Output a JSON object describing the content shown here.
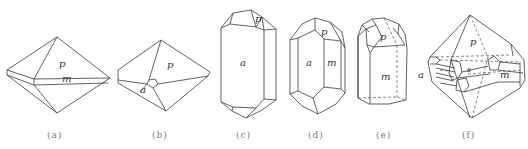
{
  "figure": {
    "panels": [
      {
        "id": "a",
        "caption": "(a)",
        "face_labels": [
          "p",
          "m"
        ]
      },
      {
        "id": "b",
        "caption": "(b)",
        "face_labels": [
          "p",
          "a"
        ]
      },
      {
        "id": "c",
        "caption": "(c)",
        "face_labels": [
          "p",
          "a"
        ]
      },
      {
        "id": "d",
        "caption": "(d)",
        "face_labels": [
          "p",
          "a",
          "m"
        ]
      },
      {
        "id": "e",
        "caption": "(e)",
        "face_labels": [
          "p",
          "m"
        ]
      },
      {
        "id": "f",
        "caption": "(f)",
        "face_labels": [
          "p",
          "a",
          "m",
          "s"
        ]
      }
    ]
  },
  "labels": {
    "a_p": "p",
    "a_m": "m",
    "b_p": "p",
    "b_a": "a",
    "c_p": "p",
    "c_a": "a",
    "d_p": "p",
    "d_a": "a",
    "d_m": "m",
    "e_p": "p",
    "e_m": "m",
    "f_p": "p",
    "f_a": "a",
    "f_m": "m",
    "f_s": "s"
  },
  "captions": {
    "a": "(a)",
    "b": "(b)",
    "c": "(c)",
    "d": "(d)",
    "e": "(e)",
    "f": "(f)"
  }
}
